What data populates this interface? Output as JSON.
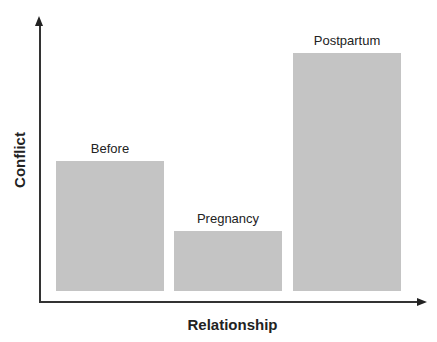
{
  "chart_data": {
    "type": "bar",
    "title": "",
    "xlabel": "Relationship",
    "ylabel": "Conflict",
    "categories": [
      "Before",
      "Pregnancy",
      "Postpartum"
    ],
    "values": [
      130,
      60,
      238
    ],
    "value_units": "relative (no numeric ticks shown; estimated from bar pixel heights)",
    "ylim": [
      0,
      270
    ],
    "grid": false,
    "legend": null,
    "bar_color": "#c4c4c4",
    "bar_labels_position": "above each bar",
    "axes_style": "arrowed axes, no tick marks"
  },
  "axes": {
    "x_title": "Relationship",
    "y_title": "Conflict"
  },
  "bars": [
    {
      "label": "Before",
      "value": 130
    },
    {
      "label": "Pregnancy",
      "value": 60
    },
    {
      "label": "Postpartum",
      "value": 238
    }
  ],
  "colors": {
    "bar": "#c4c4c4",
    "axis": "#333333",
    "text": "#222222"
  }
}
